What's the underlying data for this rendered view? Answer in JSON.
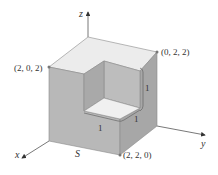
{
  "figure": {
    "type": "3d-solid",
    "colors": {
      "top_face": "#ececec",
      "left_face": "#b8b8b8",
      "right_face": "#a7a7a7",
      "notch_floor": "#f0f0f0",
      "notch_back_wall": "#a9a9a9",
      "notch_side_wall": "#bdbdbd",
      "edge": "#8a8a8a",
      "axis": "#555555"
    }
  },
  "axes": {
    "x_label": "x",
    "y_label": "y",
    "z_label": "z"
  },
  "points": [
    {
      "id": "p202",
      "label": "(2, 0, 2)"
    },
    {
      "id": "p022",
      "label": "(0, 2, 2)"
    },
    {
      "id": "p220",
      "label": "(2, 2, 0)"
    }
  ],
  "dimensions": [
    {
      "id": "dim-vertical",
      "label": "1"
    },
    {
      "id": "dim-right",
      "label": "1"
    },
    {
      "id": "dim-front",
      "label": "1"
    }
  ],
  "surface_label": "S"
}
